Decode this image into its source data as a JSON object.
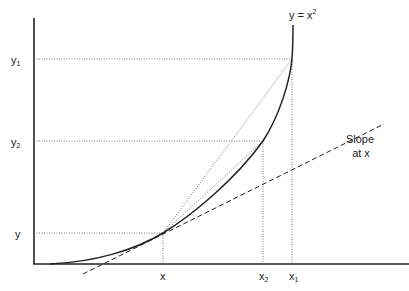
{
  "diagram": {
    "type": "function-secant-tangent",
    "curve_label": "y = x",
    "curve_exponent": "2",
    "y_labels": [
      {
        "base": "y",
        "sub": "1"
      },
      {
        "base": "y",
        "sub": "2"
      },
      {
        "base": "y",
        "sub": ""
      }
    ],
    "x_labels": [
      {
        "base": "x",
        "sub": ""
      },
      {
        "base": "x",
        "sub": "2"
      },
      {
        "base": "x",
        "sub": "1"
      }
    ],
    "tangent_label_line1": "Slope",
    "tangent_label_line2": "at x",
    "colors": {
      "axis": "#222222",
      "curve": "#222222",
      "guide": "#555555"
    }
  }
}
